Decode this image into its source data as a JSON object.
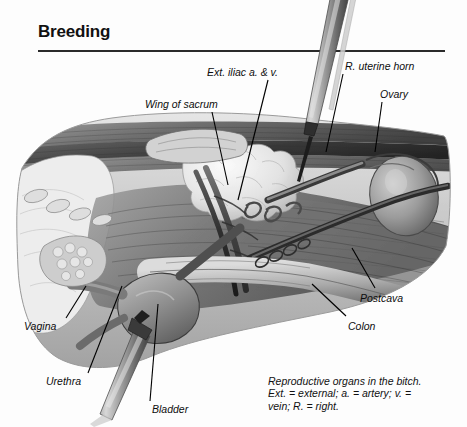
{
  "header": {
    "title": "Breeding"
  },
  "figure": {
    "alt": "Grayscale anatomical illustration: lateral dissection view of the canine pelvis showing the reproductive tract, with two surgical instruments inserted",
    "labels": [
      {
        "id": "wing-of-sacrum",
        "text": "Wing of sacrum",
        "x": 145,
        "y": 98,
        "leader": {
          "x1": 212,
          "y1": 112,
          "x2": 228,
          "y2": 185
        }
      },
      {
        "id": "ext-iliac",
        "text": "Ext. iliac a. & v.",
        "x": 207,
        "y": 66,
        "leader": {
          "x1": 268,
          "y1": 80,
          "x2": 238,
          "y2": 200
        }
      },
      {
        "id": "r-uterine-horn",
        "text": "R. uterine horn",
        "x": 345,
        "y": 60,
        "leader": {
          "x1": 343,
          "y1": 74,
          "x2": 326,
          "y2": 152
        }
      },
      {
        "id": "ovary",
        "text": "Ovary",
        "x": 380,
        "y": 88,
        "leader": {
          "x1": 382,
          "y1": 102,
          "x2": 375,
          "y2": 152
        }
      },
      {
        "id": "postcava",
        "text": "Postcava",
        "x": 360,
        "y": 292,
        "leader": {
          "x1": 375,
          "y1": 288,
          "x2": 352,
          "y2": 248
        }
      },
      {
        "id": "colon",
        "text": "Colon",
        "x": 348,
        "y": 320,
        "leader": {
          "x1": 346,
          "y1": 316,
          "x2": 312,
          "y2": 284
        }
      },
      {
        "id": "vagina",
        "text": "Vagina",
        "x": 24,
        "y": 320,
        "leader": {
          "x1": 66,
          "y1": 318,
          "x2": 86,
          "y2": 286
        }
      },
      {
        "id": "urethra",
        "text": "Urethra",
        "x": 46,
        "y": 375,
        "leader": {
          "x1": 88,
          "y1": 373,
          "x2": 122,
          "y2": 286
        }
      },
      {
        "id": "bladder",
        "text": "Bladder",
        "x": 152,
        "y": 403,
        "leader": {
          "x1": 150,
          "y1": 401,
          "x2": 158,
          "y2": 304
        }
      }
    ],
    "instruments": [
      {
        "id": "upper-instrument",
        "name": "surgical-forceps-upper"
      },
      {
        "id": "lower-instrument",
        "name": "surgical-forceps-lower"
      }
    ]
  },
  "caption": {
    "line1": "Reproductive organs in the bitch.",
    "line2": "Ext. = external; a. = artery; v. =",
    "line3": "vein; R. = right."
  },
  "bottom_cropped_text": "",
  "colors": {
    "page_background": "#fdfdfd",
    "rule": "#2a2a2a",
    "text": "#111111",
    "leader_line": "#000000",
    "illustration_mid": "#8a8a8a",
    "illustration_dark": "#3a3a3a",
    "illustration_light": "#d9d9d9"
  }
}
